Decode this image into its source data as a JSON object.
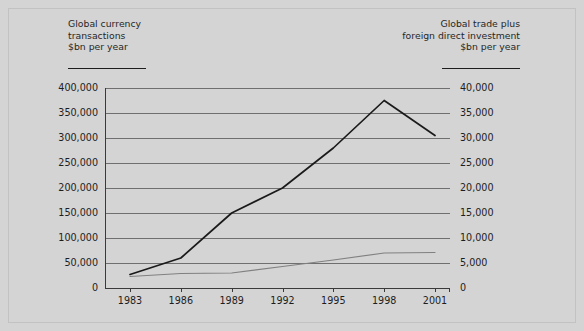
{
  "chart_data": {
    "type": "line",
    "title": "",
    "x": [
      1983,
      1986,
      1989,
      1992,
      1995,
      1998,
      2001
    ],
    "xlabel": "",
    "xtick_labels": [
      "1983",
      "1986",
      "1989",
      "1992",
      "1995",
      "1998",
      "2001"
    ],
    "grid": true,
    "legend": "none",
    "series": [
      {
        "name": "Global currency transactions",
        "axis": "left",
        "unit": "$bn per year",
        "color": "#1a1a1a",
        "values": [
          27000,
          60000,
          150000,
          200000,
          280000,
          375000,
          305000
        ]
      },
      {
        "name": "Global trade plus foreign direct investment",
        "axis": "right",
        "unit": "$bn per year",
        "color": "#808080",
        "values": [
          2300,
          2900,
          3000,
          4300,
          5600,
          7000,
          7100
        ]
      }
    ],
    "left_axis": {
      "title_lines": "Global currency\ntransactions\n$bn per year",
      "ylim": [
        0,
        400000
      ],
      "ticks": [
        400000,
        350000,
        300000,
        250000,
        200000,
        150000,
        100000,
        50000,
        0
      ],
      "tick_labels": [
        "400,000",
        "350,000",
        "300,000",
        "250,000",
        "200,000",
        "150,000",
        "100,000",
        "50,000",
        "0"
      ]
    },
    "right_axis": {
      "title_lines": "Global trade plus\nforeign direct investment\n$bn per year",
      "ylim": [
        0,
        40000
      ],
      "ticks": [
        40000,
        35000,
        30000,
        25000,
        20000,
        15000,
        10000,
        5000,
        0
      ],
      "tick_labels": [
        "40,000",
        "35,000",
        "30,000",
        "25,000",
        "20,000",
        "15,000",
        "10,000",
        "5,000",
        "0"
      ]
    },
    "colors": {
      "background": "#d4d4d4",
      "gridline": "#6f6f6f",
      "axis": "#3a3a3a",
      "text": "#1d1d1d"
    }
  }
}
